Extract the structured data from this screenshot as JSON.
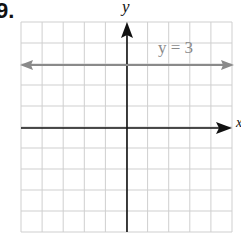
{
  "problem": {
    "number": "9."
  },
  "chart_data": {
    "type": "line",
    "title": "",
    "xlabel": "x",
    "ylabel": "y",
    "xlim": [
      -5,
      5
    ],
    "ylim": [
      -5,
      5
    ],
    "grid": true,
    "grid_step": 1,
    "series": [
      {
        "name": "y = 3",
        "equation": "y = 3",
        "x": [
          -5,
          5
        ],
        "y": [
          3,
          3
        ],
        "color": "#8a8a8a"
      }
    ],
    "annotations": [
      {
        "text": "y = 3",
        "x": 2.5,
        "y": 3.4
      }
    ]
  },
  "labels": {
    "y_axis": "y",
    "x_axis": "x",
    "line": "y = 3"
  },
  "colors": {
    "grid": "#cfcfcf",
    "axis": "#111111",
    "line": "#8a8a8a"
  }
}
